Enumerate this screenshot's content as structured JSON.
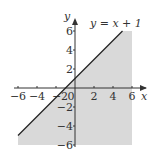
{
  "chart_data": {
    "type": "area",
    "title": "",
    "xlabel": "x",
    "ylabel": "y",
    "xlim": [
      -6,
      6
    ],
    "ylim": [
      -6,
      6
    ],
    "x_ticks": [
      -6,
      -4,
      -2,
      0,
      2,
      4,
      6
    ],
    "y_ticks": [
      -6,
      -4,
      -2,
      2,
      4,
      6
    ],
    "x_tick_labels": [
      "−6",
      "−4",
      "−2",
      "0",
      "2",
      "4",
      "6"
    ],
    "y_tick_labels": [
      "−6",
      "−4",
      "−2",
      "2",
      "4",
      "6"
    ],
    "grid": false,
    "series": [
      {
        "name": "y = x + 1",
        "kind": "line",
        "equation": "y = x + 1",
        "x": [
          -6,
          5
        ],
        "y": [
          -5,
          6
        ],
        "color": "#222222"
      },
      {
        "name": "shaded region y ≤ x + 1",
        "kind": "shaded-region",
        "inequality": "y ≤ x + 1",
        "polygon": [
          [
            -6,
            -5
          ],
          [
            5,
            6
          ],
          [
            6,
            6
          ],
          [
            6,
            -6
          ],
          [
            -6,
            -6
          ]
        ],
        "color": "#d9d9d9"
      }
    ],
    "annotations": [
      {
        "text": "y = x + 1",
        "position": "top-right near line end"
      }
    ]
  },
  "labels": {
    "equation": "y = x + 1",
    "x_axis": "x",
    "y_axis": "y",
    "origin": "0"
  },
  "colors": {
    "shade": "#d9d9d9",
    "line": "#222222",
    "axis": "#333333"
  }
}
